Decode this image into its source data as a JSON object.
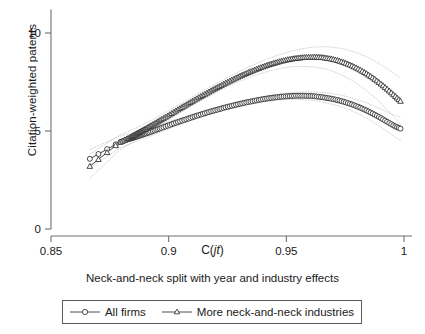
{
  "chart_data": {
    "type": "line",
    "title": "",
    "subtitle": "",
    "caption": "Neck-and-neck split with year and industry effects",
    "xlabel": "C(jt)",
    "ylabel": "Citation-weighted patents",
    "xlim": [
      0.845,
      1.005
    ],
    "ylim": [
      0,
      11.2
    ],
    "xticks": [
      0.85,
      0.9,
      0.95,
      1
    ],
    "xticklabels": [
      "0.85",
      "0.9",
      "0.95",
      "1"
    ],
    "yticks": [
      0,
      5,
      10
    ],
    "yticklabels": [
      "0",
      "5",
      "10"
    ],
    "grid": false,
    "legend_position": "bottom",
    "series": [
      {
        "name": "All firms",
        "marker": "circle",
        "color": "#2b2b2b",
        "x": [
          0.8665,
          0.879,
          0.882,
          0.884,
          0.8855,
          0.887,
          0.8885,
          0.89,
          0.892,
          0.8945,
          0.897,
          0.9,
          0.903,
          0.906,
          0.909,
          0.912,
          0.915,
          0.918,
          0.921,
          0.924,
          0.927,
          0.93,
          0.933,
          0.936,
          0.939,
          0.942,
          0.945,
          0.948,
          0.951,
          0.954,
          0.957,
          0.96,
          0.963,
          0.966,
          0.969,
          0.972,
          0.975,
          0.978,
          0.981,
          0.984,
          0.987,
          0.99,
          0.993,
          0.996,
          0.9985
        ],
        "y": [
          3.58,
          4.42,
          4.55,
          4.62,
          4.68,
          4.74,
          4.8,
          4.86,
          4.94,
          5.05,
          5.16,
          5.29,
          5.42,
          5.54,
          5.66,
          5.78,
          5.89,
          6.0,
          6.1,
          6.2,
          6.29,
          6.38,
          6.46,
          6.53,
          6.6,
          6.66,
          6.71,
          6.75,
          6.78,
          6.8,
          6.8,
          6.79,
          6.76,
          6.71,
          6.65,
          6.57,
          6.47,
          6.35,
          6.21,
          6.05,
          5.87,
          5.67,
          5.46,
          5.25,
          5.12
        ],
        "ci_upper": [
          4.05,
          4.72,
          4.82,
          4.88,
          4.93,
          4.98,
          5.03,
          5.08,
          5.15,
          5.25,
          5.35,
          5.47,
          5.59,
          5.7,
          5.81,
          5.92,
          6.02,
          6.13,
          6.22,
          6.32,
          6.41,
          6.5,
          6.58,
          6.66,
          6.73,
          6.8,
          6.86,
          6.91,
          6.95,
          6.98,
          7.0,
          7.0,
          6.99,
          6.96,
          6.92,
          6.86,
          6.78,
          6.68,
          6.57,
          6.44,
          6.29,
          6.13,
          5.96,
          5.8,
          5.71
        ],
        "ci_lower": [
          3.11,
          4.12,
          4.28,
          4.36,
          4.43,
          4.5,
          4.57,
          4.64,
          4.73,
          4.85,
          4.97,
          5.11,
          5.25,
          5.38,
          5.51,
          5.64,
          5.76,
          5.87,
          5.98,
          6.08,
          6.17,
          6.26,
          6.34,
          6.4,
          6.47,
          6.52,
          6.56,
          6.59,
          6.61,
          6.62,
          6.6,
          6.58,
          6.53,
          6.46,
          6.38,
          6.28,
          6.16,
          6.02,
          5.85,
          5.66,
          5.45,
          5.21,
          4.96,
          4.7,
          4.53
        ]
      },
      {
        "name": "More neck-and-neck industries",
        "marker": "triangle",
        "color": "#2b2b2b",
        "x": [
          0.8665,
          0.879,
          0.882,
          0.884,
          0.8855,
          0.887,
          0.8885,
          0.89,
          0.892,
          0.8945,
          0.897,
          0.9,
          0.903,
          0.906,
          0.909,
          0.912,
          0.915,
          0.918,
          0.921,
          0.924,
          0.927,
          0.93,
          0.933,
          0.936,
          0.939,
          0.942,
          0.945,
          0.948,
          0.951,
          0.954,
          0.957,
          0.96,
          0.963,
          0.966,
          0.969,
          0.972,
          0.975,
          0.978,
          0.981,
          0.984,
          0.987,
          0.99,
          0.993,
          0.996,
          0.9985
        ],
        "y": [
          3.2,
          4.4,
          4.58,
          4.7,
          4.8,
          4.9,
          5.0,
          5.1,
          5.24,
          5.41,
          5.59,
          5.8,
          6.02,
          6.23,
          6.44,
          6.65,
          6.85,
          7.05,
          7.24,
          7.43,
          7.61,
          7.78,
          7.94,
          8.09,
          8.23,
          8.36,
          8.47,
          8.57,
          8.65,
          8.71,
          8.75,
          8.77,
          8.77,
          8.74,
          8.68,
          8.59,
          8.47,
          8.32,
          8.14,
          7.93,
          7.69,
          7.42,
          7.12,
          6.8,
          6.52
        ],
        "ci_upper": [
          3.82,
          4.78,
          4.93,
          5.03,
          5.11,
          5.2,
          5.29,
          5.38,
          5.51,
          5.67,
          5.84,
          6.04,
          6.25,
          6.45,
          6.66,
          6.87,
          7.07,
          7.27,
          7.47,
          7.66,
          7.85,
          8.03,
          8.21,
          8.37,
          8.53,
          8.68,
          8.81,
          8.93,
          9.04,
          9.13,
          9.2,
          9.26,
          9.29,
          9.3,
          9.28,
          9.24,
          9.17,
          9.07,
          8.94,
          8.79,
          8.61,
          8.4,
          8.17,
          7.92,
          7.7
        ],
        "ci_lower": [
          2.58,
          4.02,
          4.23,
          4.37,
          4.49,
          4.6,
          4.71,
          4.82,
          4.97,
          5.15,
          5.34,
          5.56,
          5.79,
          6.01,
          6.22,
          6.43,
          6.63,
          6.83,
          7.01,
          7.2,
          7.37,
          7.53,
          7.67,
          7.81,
          7.93,
          8.04,
          8.13,
          8.21,
          8.26,
          8.29,
          8.3,
          8.28,
          8.25,
          8.18,
          8.08,
          7.94,
          7.77,
          7.57,
          7.34,
          7.07,
          6.77,
          6.44,
          6.07,
          5.68,
          5.34
        ]
      }
    ]
  },
  "axes": {
    "xlabel": "C(jt)",
    "xlabel_prefix": "C(",
    "xlabel_italic": "jt",
    "xlabel_suffix": ")",
    "ylabel": "Citation-weighted patents"
  },
  "caption": {
    "text": "Neck-and-neck split with year and industry effects"
  },
  "legend": {
    "items": [
      {
        "label": "All firms",
        "marker": "circle-marker"
      },
      {
        "label": "More neck-and-neck industries",
        "marker": "triangle-marker"
      }
    ]
  }
}
